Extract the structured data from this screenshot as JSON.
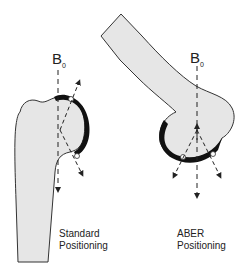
{
  "diagram": {
    "left": {
      "field_label": "B",
      "field_subscript": "0",
      "caption_line1": "Standard",
      "caption_line2": "Positioning"
    },
    "right": {
      "field_label": "B",
      "field_subscript": "0",
      "caption_line1": "ABER",
      "caption_line2": "Positioning"
    },
    "colors": {
      "bone_fill": "#e6e6e6",
      "outline": "#333333",
      "cartilage": "#111111",
      "background": "#ffffff"
    }
  }
}
